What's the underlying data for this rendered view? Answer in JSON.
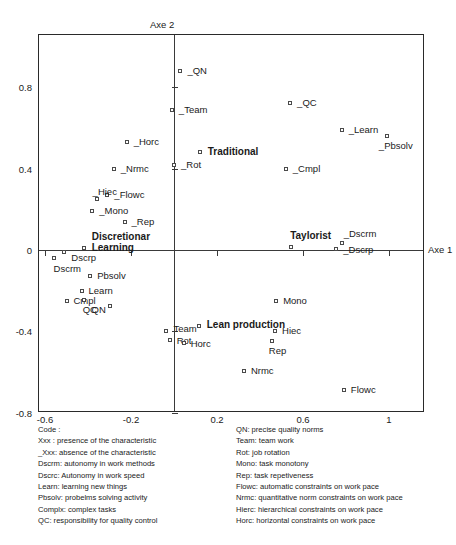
{
  "chart_data": {
    "type": "scatter",
    "title": "",
    "xlabel": "Axe 1",
    "ylabel": "Axe 2",
    "xlim": [
      -0.63,
      1.17
    ],
    "ylim": [
      -0.86,
      0.95
    ],
    "xticks": [
      "-0.6",
      "-0.2",
      "0.2",
      "0.6",
      "1"
    ],
    "xtick_values": [
      -0.6,
      -0.2,
      0.2,
      0.6,
      1.0
    ],
    "yticks": [
      "0.8",
      "0.4",
      "0",
      "-0.4",
      "-0.8"
    ],
    "ytick_values": [
      0.8,
      0.4,
      0.0,
      -0.4,
      -0.8
    ],
    "grid": false,
    "legend": "none",
    "points": [
      {
        "label": "_QN",
        "x": 0.03,
        "y": 0.88,
        "lx": 7,
        "ly": -5,
        "bold": false
      },
      {
        "label": "_Team",
        "x": -0.01,
        "y": 0.69,
        "lx": 7,
        "ly": -5,
        "bold": false
      },
      {
        "label": "_QC",
        "x": 0.54,
        "y": 0.72,
        "lx": 7,
        "ly": -5,
        "bold": false
      },
      {
        "label": "_Learn",
        "x": 0.78,
        "y": 0.59,
        "lx": 7,
        "ly": -5,
        "bold": false
      },
      {
        "label": "_Pbsolv",
        "x": 0.99,
        "y": 0.56,
        "lx": -8,
        "ly": 5,
        "bold": false
      },
      {
        "label": "_Horc",
        "x": -0.22,
        "y": 0.53,
        "lx": 7,
        "ly": -5,
        "bold": false
      },
      {
        "label": "Traditional",
        "x": 0.12,
        "y": 0.48,
        "lx": 8,
        "ly": -5,
        "bold": true
      },
      {
        "label": "_Rot",
        "x": 0.0,
        "y": 0.42,
        "lx": 7,
        "ly": -5,
        "bold": false
      },
      {
        "label": "_Nrmc",
        "x": -0.28,
        "y": 0.4,
        "lx": 7,
        "ly": -5,
        "bold": false
      },
      {
        "label": "_Cmpl",
        "x": 0.52,
        "y": 0.4,
        "lx": 7,
        "ly": -5,
        "bold": false
      },
      {
        "label": "_Flowc",
        "x": -0.31,
        "y": 0.27,
        "lx": 7,
        "ly": -5,
        "bold": false
      },
      {
        "label": "_Hiec",
        "x": -0.36,
        "y": 0.25,
        "lx": -4,
        "ly": -12,
        "bold": false
      },
      {
        "label": "_Mono",
        "x": -0.38,
        "y": 0.19,
        "lx": 7,
        "ly": -5,
        "bold": false
      },
      {
        "label": "_Rep",
        "x": -0.23,
        "y": 0.14,
        "lx": 7,
        "ly": -5,
        "bold": false
      },
      {
        "label": "Discretionar",
        "x": -0.42,
        "y": 0.01,
        "lx": 8,
        "ly": -17,
        "bold": true,
        "line2": "Learning"
      },
      {
        "label": "Dscrp",
        "x": -0.51,
        "y": -0.01,
        "lx": 7,
        "ly": 1,
        "bold": false
      },
      {
        "label": "Dscrm",
        "x": -0.56,
        "y": -0.04,
        "lx": 0,
        "ly": 6,
        "bold": false
      },
      {
        "label": "Taylorist",
        "x": 0.545,
        "y": 0.015,
        "lx": -1,
        "ly": -16,
        "bold": true
      },
      {
        "label": "_Dscrm",
        "x": 0.78,
        "y": 0.035,
        "lx": 2,
        "ly": -14,
        "bold": false
      },
      {
        "label": "_Dscrp",
        "x": 0.755,
        "y": 0.005,
        "lx": 7,
        "ly": -4,
        "bold": false
      },
      {
        "label": "Pbsolv",
        "x": -0.39,
        "y": -0.13,
        "lx": 7,
        "ly": -5,
        "bold": false
      },
      {
        "label": "Learn",
        "x": -0.43,
        "y": -0.2,
        "lx": 7,
        "ly": -5,
        "bold": false
      },
      {
        "label": "Mono",
        "x": 0.475,
        "y": -0.25,
        "lx": 7,
        "ly": -5,
        "bold": false
      },
      {
        "label": "Cmpl",
        "x": -0.5,
        "y": -0.25,
        "lx": 7,
        "ly": -5,
        "bold": false
      },
      {
        "label": "QC",
        "x": -0.42,
        "y": -0.245,
        "lx": -1,
        "ly": 5,
        "bold": false
      },
      {
        "label": "QN",
        "x": -0.3,
        "y": -0.275,
        "lx": -18,
        "ly": -1,
        "bold": false
      },
      {
        "label": "Team",
        "x": -0.035,
        "y": -0.4,
        "lx": 7,
        "ly": -7,
        "bold": false
      },
      {
        "label": "Lean production",
        "x": 0.115,
        "y": -0.375,
        "lx": 8,
        "ly": -6,
        "bold": true
      },
      {
        "label": "Hiec",
        "x": 0.47,
        "y": -0.4,
        "lx": 7,
        "ly": -5,
        "bold": false
      },
      {
        "label": "Rot",
        "x": -0.02,
        "y": -0.44,
        "lx": 7,
        "ly": -4,
        "bold": false
      },
      {
        "label": "Horc",
        "x": 0.045,
        "y": -0.455,
        "lx": 7,
        "ly": -4,
        "bold": false
      },
      {
        "label": "Rep",
        "x": 0.455,
        "y": -0.445,
        "lx": -3,
        "ly": 5,
        "bold": false
      },
      {
        "label": "Nrmc",
        "x": 0.325,
        "y": -0.595,
        "lx": 7,
        "ly": -5,
        "bold": false
      },
      {
        "label": "Flowc",
        "x": 0.79,
        "y": -0.69,
        "lx": 7,
        "ly": -5,
        "bold": false
      }
    ]
  },
  "axes": {
    "axe2_label": "Axe 2",
    "axe1_label": "Axe 1"
  },
  "legend": {
    "left": [
      "Code :",
      "Xxx : presence of the characteristic",
      "_Xxx: absence of the characteristic",
      "Dscrm: autonomy in work methods",
      "Dscrc: Autonomy in work speed",
      "Learn: learning new things",
      "Pbsolv: probelms solving activity",
      "Complx: complex tasks",
      "QC: responsibility for quality control"
    ],
    "right": [
      "QN: precise quality norms",
      "Team: team work",
      "Rot: job rotation",
      "Mono: task monotony",
      "Rep: task repetiveness",
      "Flowc: automatic constraints on work pace",
      "Nrmc: quantitative norm constraints on work pace",
      "Hierc: hierarchical constraints on work pace",
      "Horc: horizontal constraints on work pace"
    ]
  },
  "colors": {
    "frame": "#2a2a2a",
    "axis": "#3a3a3a",
    "marker_stroke": "#4a4a4a",
    "text": "#1a1a1a",
    "background": "#ffffff"
  }
}
